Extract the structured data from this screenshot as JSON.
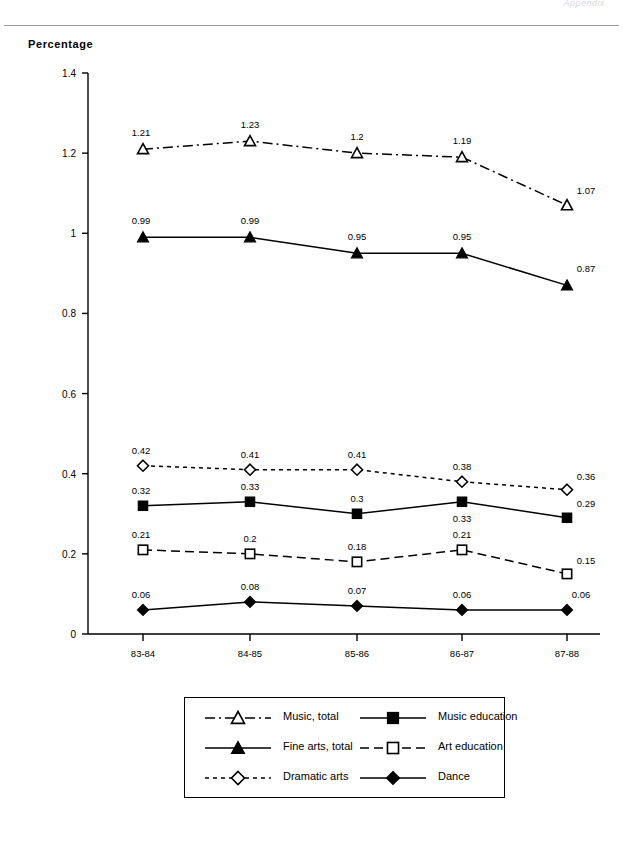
{
  "header": {
    "corner_note": "Appendix",
    "axis_title": "Percentage"
  },
  "chart_data": {
    "type": "line",
    "title": "",
    "xlabel": "",
    "ylabel": "Percentage",
    "categories": [
      "83-84",
      "84-85",
      "85-86",
      "86-87",
      "87-88"
    ],
    "ylim": [
      0,
      1.4
    ],
    "yticks": [
      "0",
      "0.2",
      "0.4",
      "0.6",
      "0.8",
      "1",
      "1.2",
      "1.4"
    ],
    "ytick_values": [
      0,
      0.2,
      0.4,
      0.6,
      0.8,
      1,
      1.2,
      1.4
    ],
    "grid": false,
    "legend_position": "bottom",
    "series": [
      {
        "name": "Music, total",
        "marker": "open-triangle",
        "line": "dash-dot",
        "values": [
          1.21,
          1.23,
          1.2,
          1.19,
          1.07
        ],
        "labels": [
          "1.21",
          "1.23",
          "1.2",
          "1.19",
          "1.07"
        ]
      },
      {
        "name": "Music education",
        "marker": "filled-square",
        "line": "solid",
        "values": [
          0.32,
          0.33,
          0.3,
          0.33,
          0.29
        ],
        "labels": [
          "0.32",
          "0.33",
          "0.3",
          "0.33",
          "0.29"
        ]
      },
      {
        "name": "Fine arts, total",
        "marker": "filled-triangle",
        "line": "solid",
        "values": [
          0.99,
          0.99,
          0.95,
          0.95,
          0.87
        ],
        "labels": [
          "0.99",
          "0.99",
          "0.95",
          "0.95",
          "0.87"
        ]
      },
      {
        "name": "Art education",
        "marker": "open-square",
        "line": "dashed",
        "values": [
          0.21,
          0.2,
          0.18,
          0.21,
          0.15
        ],
        "labels": [
          "0.21",
          "0.2",
          "0.18",
          "0.21",
          "0.15"
        ]
      },
      {
        "name": "Dramatic arts",
        "marker": "open-diamond",
        "line": "dotted",
        "values": [
          0.42,
          0.41,
          0.41,
          0.38,
          0.36
        ],
        "labels": [
          "0.42",
          "0.41",
          "0.41",
          "0.38",
          "0.36"
        ]
      },
      {
        "name": "Dance",
        "marker": "filled-diamond",
        "line": "solid",
        "values": [
          0.06,
          0.08,
          0.07,
          0.06,
          0.06
        ],
        "labels": [
          "0.06",
          "0.08",
          "0.07",
          "0.06",
          "0.06"
        ]
      }
    ]
  },
  "legend": {
    "entries": [
      {
        "label": "Music, total"
      },
      {
        "label": "Music education"
      },
      {
        "label": "Fine arts, total"
      },
      {
        "label": "Art education"
      },
      {
        "label": "Dramatic arts"
      },
      {
        "label": "Dance"
      }
    ]
  },
  "colors": {
    "ink": "#000000",
    "rule": "#9a9a9a"
  }
}
